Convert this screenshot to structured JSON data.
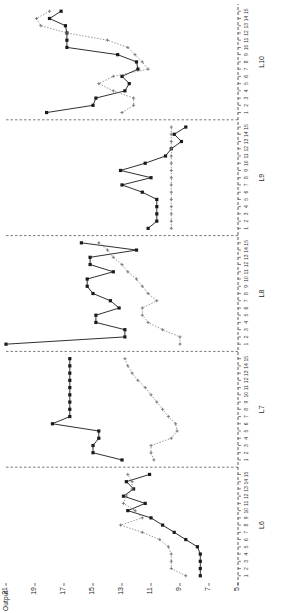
{
  "chart_data": {
    "type": "line",
    "title": "",
    "xlabel": "",
    "ylabel": "Output",
    "ylim": [
      5,
      21
    ],
    "yticks": [
      21,
      19,
      17,
      15,
      13,
      11,
      9,
      7,
      5
    ],
    "grid": false,
    "legend_position": "none",
    "panel_labels": [
      "L6",
      "L7",
      "L8",
      "L9",
      "L10"
    ],
    "xtick_labels": [
      "1",
      "2",
      "3",
      "4",
      "5",
      "6",
      "7",
      "8",
      "9",
      "10",
      "11",
      "12",
      "13",
      "14",
      "15"
    ],
    "series": [
      {
        "name": "solid-series",
        "style": "solid",
        "marker": "filled-square",
        "color": "#1a1a1a",
        "panels": {
          "L6": [
            7.6,
            7.6,
            7.6,
            7.6,
            7.8,
            8.6,
            9.4,
            10.2,
            11.0,
            12.6,
            11.4,
            12.9,
            12.2,
            12.7,
            11.1
          ],
          "L7": [
            13.0,
            15.0,
            15.0,
            14.6,
            14.6,
            17.8,
            16.6,
            16.6,
            16.6,
            16.6,
            16.6,
            16.6,
            16.6,
            16.6,
            16.6
          ],
          "L8": [
            21.0,
            12.8,
            12.8,
            14.8,
            14.8,
            13.2,
            13.8,
            15.0,
            15.4,
            15.4,
            13.6,
            15.2,
            15.2,
            12.0,
            15.8
          ],
          "L9": [
            11.2,
            10.6,
            10.6,
            10.6,
            10.6,
            11.6,
            13.0,
            11.0,
            13.1,
            11.4,
            10.0,
            9.6,
            8.9,
            9.4,
            8.6
          ],
          "L10": [
            18.2,
            15.0,
            14.8,
            12.8,
            12.5,
            13.0,
            11.9,
            12.0,
            13.3,
            16.8,
            16.8,
            16.8,
            16.9,
            18.0,
            17.2
          ]
        }
      },
      {
        "name": "dotted-series",
        "style": "dotted",
        "marker": "small-cross",
        "color": "#6f6f6f",
        "panels": {
          "L6": [
            8.6,
            9.6,
            9.6,
            9.6,
            9.8,
            10.4,
            11.6,
            13.1,
            11.6,
            12.1,
            12.9,
            12.7,
            12.3,
            12.3,
            12.6
          ],
          "L7": [
            10.8,
            11.0,
            11.0,
            9.6,
            9.2,
            9.3,
            9.8,
            10.2,
            10.6,
            11.0,
            11.4,
            11.9,
            12.3,
            12.6,
            12.8
          ],
          "L8": [
            9.0,
            9.0,
            10.2,
            11.2,
            11.6,
            11.6,
            10.6,
            11.2,
            11.6,
            12.0,
            12.6,
            13.0,
            13.6,
            14.0,
            14.6
          ],
          "L9": [
            9.6,
            9.6,
            9.6,
            9.6,
            9.6,
            9.6,
            9.6,
            9.6,
            9.6,
            9.6,
            9.6,
            9.6,
            9.6,
            9.6,
            9.6
          ],
          "L10": [
            13.0,
            12.2,
            12.2,
            13.6,
            14.6,
            13.6,
            11.2,
            11.6,
            12.1,
            12.6,
            14.0,
            16.8,
            18.6,
            18.9,
            18.0
          ]
        }
      }
    ]
  },
  "axis": {
    "y_axis_label": "Output"
  }
}
